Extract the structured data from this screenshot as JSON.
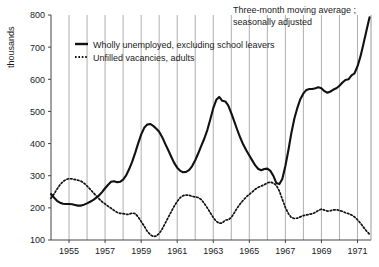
{
  "chart_data": {
    "type": "line",
    "title": "",
    "annotation": {
      "line1": "Three-month moving average ;",
      "line2": "seasonally adjusted"
    },
    "xlabel": "",
    "ylabel": "thousands",
    "xlim": [
      1954.0,
      1971.75
    ],
    "ylim": [
      100,
      800
    ],
    "y_ticks": [
      100,
      200,
      300,
      400,
      500,
      600,
      700,
      800
    ],
    "y_tick_labels": [
      "100",
      "200",
      "300",
      "400",
      "500",
      "600",
      "700",
      "800"
    ],
    "x_ticks": [
      1955,
      1957,
      1959,
      1961,
      1963,
      1965,
      1967,
      1969,
      1971
    ],
    "x_tick_labels": [
      "1955",
      "1957",
      "1959",
      "1961",
      "1963",
      "1965",
      "1967",
      "1969",
      "1971"
    ],
    "x_gridlines": [
      1955,
      1956,
      1957,
      1958,
      1959,
      1960,
      1961,
      1962,
      1963,
      1964,
      1965,
      1966,
      1967,
      1968,
      1969,
      1970,
      1971
    ],
    "grid": "vertical-only",
    "legend_position": "upper-left-inside",
    "series": [
      {
        "name": "Wholly unemployed, excluding school leavers",
        "style": "solid",
        "color": "#111111",
        "points": [
          [
            1954.0,
            243
          ],
          [
            1954.17,
            232
          ],
          [
            1954.33,
            222
          ],
          [
            1954.5,
            216
          ],
          [
            1954.67,
            213
          ],
          [
            1954.83,
            212
          ],
          [
            1955.0,
            212
          ],
          [
            1955.17,
            211
          ],
          [
            1955.33,
            209
          ],
          [
            1955.5,
            207
          ],
          [
            1955.67,
            207
          ],
          [
            1955.83,
            210
          ],
          [
            1956.0,
            214
          ],
          [
            1956.17,
            219
          ],
          [
            1956.33,
            224
          ],
          [
            1956.5,
            231
          ],
          [
            1956.67,
            239
          ],
          [
            1956.83,
            249
          ],
          [
            1957.0,
            261
          ],
          [
            1957.17,
            272
          ],
          [
            1957.33,
            281
          ],
          [
            1957.5,
            283
          ],
          [
            1957.67,
            280
          ],
          [
            1957.83,
            281
          ],
          [
            1958.0,
            288
          ],
          [
            1958.17,
            301
          ],
          [
            1958.33,
            320
          ],
          [
            1958.5,
            343
          ],
          [
            1958.67,
            371
          ],
          [
            1958.83,
            400
          ],
          [
            1959.0,
            428
          ],
          [
            1959.17,
            449
          ],
          [
            1959.33,
            459
          ],
          [
            1959.5,
            461
          ],
          [
            1959.67,
            455
          ],
          [
            1959.83,
            447
          ],
          [
            1960.0,
            437
          ],
          [
            1960.17,
            420
          ],
          [
            1960.33,
            400
          ],
          [
            1960.5,
            380
          ],
          [
            1960.67,
            359
          ],
          [
            1960.83,
            340
          ],
          [
            1961.0,
            325
          ],
          [
            1961.17,
            315
          ],
          [
            1961.33,
            311
          ],
          [
            1961.5,
            312
          ],
          [
            1961.67,
            318
          ],
          [
            1961.83,
            330
          ],
          [
            1962.0,
            348
          ],
          [
            1962.17,
            370
          ],
          [
            1962.33,
            392
          ],
          [
            1962.5,
            415
          ],
          [
            1962.67,
            442
          ],
          [
            1962.83,
            474
          ],
          [
            1963.0,
            510
          ],
          [
            1963.17,
            536
          ],
          [
            1963.33,
            545
          ],
          [
            1963.5,
            533
          ],
          [
            1963.67,
            531
          ],
          [
            1963.83,
            519
          ],
          [
            1964.0,
            495
          ],
          [
            1964.17,
            468
          ],
          [
            1964.33,
            443
          ],
          [
            1964.5,
            418
          ],
          [
            1964.67,
            396
          ],
          [
            1964.83,
            379
          ],
          [
            1965.0,
            363
          ],
          [
            1965.17,
            347
          ],
          [
            1965.33,
            332
          ],
          [
            1965.5,
            321
          ],
          [
            1965.67,
            317
          ],
          [
            1965.83,
            321
          ],
          [
            1966.0,
            322
          ],
          [
            1966.17,
            315
          ],
          [
            1966.33,
            300
          ],
          [
            1966.5,
            277
          ],
          [
            1966.67,
            274
          ],
          [
            1966.83,
            290
          ],
          [
            1967.0,
            330
          ],
          [
            1967.17,
            380
          ],
          [
            1967.33,
            432
          ],
          [
            1967.5,
            478
          ],
          [
            1967.67,
            512
          ],
          [
            1967.83,
            538
          ],
          [
            1968.0,
            556
          ],
          [
            1968.17,
            567
          ],
          [
            1968.33,
            570
          ],
          [
            1968.5,
            570
          ],
          [
            1968.67,
            572
          ],
          [
            1968.83,
            575
          ],
          [
            1969.0,
            572
          ],
          [
            1969.17,
            563
          ],
          [
            1969.33,
            558
          ],
          [
            1969.5,
            562
          ],
          [
            1969.67,
            568
          ],
          [
            1969.83,
            572
          ],
          [
            1970.0,
            580
          ],
          [
            1970.17,
            590
          ],
          [
            1970.33,
            598
          ],
          [
            1970.5,
            600
          ],
          [
            1970.67,
            612
          ],
          [
            1970.83,
            618
          ],
          [
            1971.0,
            640
          ],
          [
            1971.17,
            672
          ],
          [
            1971.33,
            710
          ],
          [
            1971.5,
            752
          ],
          [
            1971.67,
            793
          ]
        ]
      },
      {
        "name": "Unfilled vacancies, adults",
        "style": "dotted",
        "color": "#111111",
        "points": [
          [
            1954.0,
            230
          ],
          [
            1954.17,
            243
          ],
          [
            1954.33,
            258
          ],
          [
            1954.5,
            272
          ],
          [
            1954.67,
            282
          ],
          [
            1954.83,
            288
          ],
          [
            1955.0,
            291
          ],
          [
            1955.17,
            290
          ],
          [
            1955.33,
            288
          ],
          [
            1955.5,
            286
          ],
          [
            1955.67,
            283
          ],
          [
            1955.83,
            277
          ],
          [
            1956.0,
            268
          ],
          [
            1956.17,
            258
          ],
          [
            1956.33,
            248
          ],
          [
            1956.5,
            238
          ],
          [
            1956.67,
            228
          ],
          [
            1956.83,
            219
          ],
          [
            1957.0,
            212
          ],
          [
            1957.17,
            205
          ],
          [
            1957.33,
            199
          ],
          [
            1957.5,
            192
          ],
          [
            1957.67,
            186
          ],
          [
            1957.83,
            183
          ],
          [
            1958.0,
            182
          ],
          [
            1958.17,
            180
          ],
          [
            1958.33,
            180
          ],
          [
            1958.5,
            184
          ],
          [
            1958.67,
            182
          ],
          [
            1958.83,
            172
          ],
          [
            1959.0,
            158
          ],
          [
            1959.17,
            143
          ],
          [
            1959.33,
            128
          ],
          [
            1959.5,
            117
          ],
          [
            1959.67,
            111
          ],
          [
            1959.83,
            112
          ],
          [
            1960.0,
            120
          ],
          [
            1960.17,
            134
          ],
          [
            1960.33,
            152
          ],
          [
            1960.5,
            170
          ],
          [
            1960.67,
            188
          ],
          [
            1960.83,
            205
          ],
          [
            1961.0,
            220
          ],
          [
            1961.17,
            232
          ],
          [
            1961.33,
            238
          ],
          [
            1961.5,
            240
          ],
          [
            1961.67,
            239
          ],
          [
            1961.83,
            236
          ],
          [
            1962.0,
            234
          ],
          [
            1962.17,
            232
          ],
          [
            1962.33,
            226
          ],
          [
            1962.5,
            214
          ],
          [
            1962.67,
            200
          ],
          [
            1962.83,
            185
          ],
          [
            1963.0,
            170
          ],
          [
            1963.17,
            158
          ],
          [
            1963.33,
            152
          ],
          [
            1963.5,
            153
          ],
          [
            1963.67,
            162
          ],
          [
            1963.83,
            163
          ],
          [
            1964.0,
            170
          ],
          [
            1964.17,
            185
          ],
          [
            1964.33,
            200
          ],
          [
            1964.5,
            213
          ],
          [
            1964.67,
            224
          ],
          [
            1964.83,
            234
          ],
          [
            1965.0,
            242
          ],
          [
            1965.17,
            250
          ],
          [
            1965.33,
            258
          ],
          [
            1965.5,
            264
          ],
          [
            1965.67,
            268
          ],
          [
            1965.83,
            272
          ],
          [
            1966.0,
            278
          ],
          [
            1966.17,
            280
          ],
          [
            1966.33,
            277
          ],
          [
            1966.5,
            270
          ],
          [
            1966.67,
            252
          ],
          [
            1966.83,
            227
          ],
          [
            1967.0,
            201
          ],
          [
            1967.17,
            182
          ],
          [
            1967.33,
            170
          ],
          [
            1967.5,
            167
          ],
          [
            1967.67,
            168
          ],
          [
            1967.83,
            172
          ],
          [
            1968.0,
            176
          ],
          [
            1968.17,
            178
          ],
          [
            1968.33,
            180
          ],
          [
            1968.5,
            182
          ],
          [
            1968.67,
            186
          ],
          [
            1968.83,
            192
          ],
          [
            1969.0,
            196
          ],
          [
            1969.17,
            193
          ],
          [
            1969.33,
            190
          ],
          [
            1969.5,
            191
          ],
          [
            1969.67,
            194
          ],
          [
            1969.83,
            194
          ],
          [
            1970.0,
            192
          ],
          [
            1970.17,
            189
          ],
          [
            1970.33,
            185
          ],
          [
            1970.5,
            182
          ],
          [
            1970.67,
            178
          ],
          [
            1970.83,
            172
          ],
          [
            1971.0,
            163
          ],
          [
            1971.17,
            152
          ],
          [
            1971.33,
            140
          ],
          [
            1971.5,
            128
          ],
          [
            1971.67,
            118
          ]
        ]
      }
    ]
  },
  "legend": {
    "items": [
      {
        "label": "Wholly unemployed, excluding school leavers",
        "style": "solid"
      },
      {
        "label": "Unfilled vacancies, adults",
        "style": "dotted"
      }
    ]
  },
  "colors": {
    "line": "#111111",
    "grid": "#9a9a9a",
    "axis": "#444444",
    "background": "#ffffff",
    "text": "#1a1a1a"
  }
}
